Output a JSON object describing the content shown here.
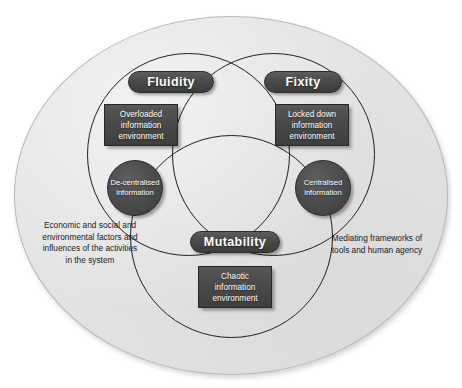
{
  "diagram": {
    "outer_region": {
      "name": "system-boundary-ellipse",
      "fill_color": "#e3e3e3",
      "border_color": "#b9b9b9"
    },
    "accent_color": "#484848",
    "label_text_color": "#ffffff",
    "circles": [
      {
        "id": "fluidity",
        "label": "Fluidity",
        "position": "top-left"
      },
      {
        "id": "fixity",
        "label": "Fixity",
        "position": "top-right"
      },
      {
        "id": "mutability",
        "label": "Mutability",
        "position": "bottom-center"
      }
    ],
    "nodes": {
      "overloaded": {
        "shape": "rectangle",
        "line1": "Overloaded",
        "line2": "information",
        "line3": "environment"
      },
      "locked_down": {
        "shape": "rectangle",
        "line1": "Locked down",
        "line2": "information",
        "line3": "environment"
      },
      "chaotic": {
        "shape": "rectangle",
        "line1": "Chaotic",
        "line2": "information",
        "line3": "environment"
      },
      "decentralised": {
        "shape": "circle",
        "line1": "De-centralised",
        "line2": "information"
      },
      "centralised": {
        "shape": "circle",
        "line1": "Centralised",
        "line2": "information"
      }
    },
    "annotations": {
      "left": {
        "line1": "Economic and social and",
        "line2": "environmental factors and",
        "line3": "influences of the activities",
        "line4": "in the system"
      },
      "right": {
        "line1": "Mediating frameworks of",
        "line2": "tools and human agency"
      }
    }
  }
}
